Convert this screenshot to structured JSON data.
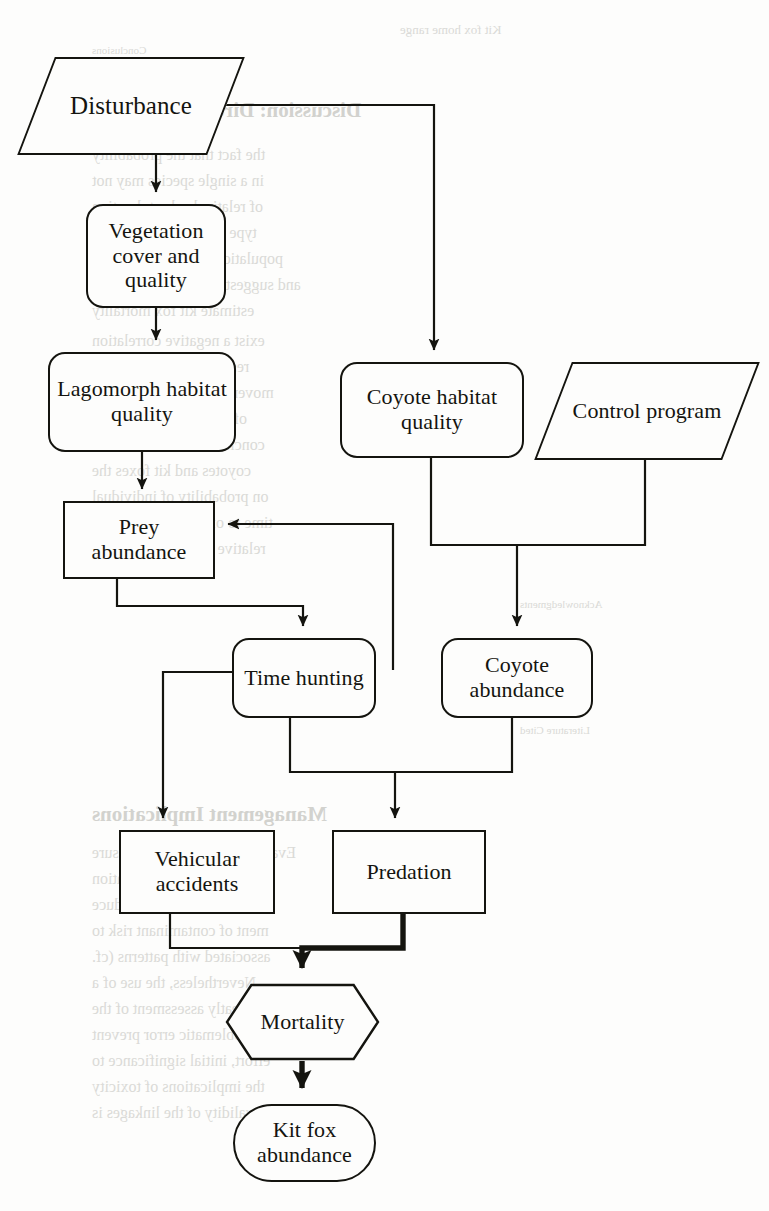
{
  "figure": {
    "line_color": "#14140f",
    "background": "#fdfdfc",
    "nodes": [
      {
        "id": "disturbance",
        "label": "Disturbance",
        "shape": "parallelogram",
        "x": 36,
        "y": 57,
        "w": 190,
        "h": 98,
        "font": 25
      },
      {
        "id": "vegetation",
        "label": "Vegetation cover and quality",
        "shape": "rounded",
        "x": 86,
        "y": 204,
        "w": 140,
        "h": 104,
        "font": 22
      },
      {
        "id": "lagomorph",
        "label": "Lagomorph habitat quality",
        "shape": "rounded",
        "x": 48,
        "y": 352,
        "w": 188,
        "h": 100,
        "font": 22
      },
      {
        "id": "coyote-habitat",
        "label": "Coyote habitat quality",
        "shape": "rounded",
        "x": 340,
        "y": 362,
        "w": 184,
        "h": 96,
        "font": 22
      },
      {
        "id": "control-program",
        "label": "Control program",
        "shape": "parallelogram",
        "x": 553,
        "y": 362,
        "w": 188,
        "h": 98,
        "font": 22
      },
      {
        "id": "prey-abundance",
        "label": "Prey abundance",
        "shape": "rect",
        "x": 63,
        "y": 501,
        "w": 152,
        "h": 78,
        "font": 22
      },
      {
        "id": "time-hunting",
        "label": "Time hunting",
        "shape": "rounded",
        "x": 232,
        "y": 638,
        "w": 144,
        "h": 80,
        "font": 22
      },
      {
        "id": "coyote-abundance",
        "label": "Coyote abundance",
        "shape": "rounded",
        "x": 441,
        "y": 638,
        "w": 152,
        "h": 80,
        "font": 22
      },
      {
        "id": "vehicular",
        "label": "Vehicular accidents",
        "shape": "rect",
        "x": 119,
        "y": 830,
        "w": 156,
        "h": 84,
        "font": 22
      },
      {
        "id": "predation",
        "label": "Predation",
        "shape": "rect",
        "x": 332,
        "y": 830,
        "w": 154,
        "h": 84,
        "font": 22
      },
      {
        "id": "mortality",
        "label": "Mortality",
        "shape": "hexagon",
        "x": 225,
        "y": 983,
        "w": 155,
        "h": 78,
        "font": 22
      },
      {
        "id": "kit-fox",
        "label": "Kit fox abundance",
        "shape": "stadium",
        "x": 233,
        "y": 1104,
        "w": 143,
        "h": 78,
        "font": 22
      }
    ],
    "edges": [
      {
        "id": "disturbance-to-vegetation",
        "from": "disturbance",
        "to": "vegetation",
        "weight": "thin"
      },
      {
        "id": "disturbance-to-coyote-habitat",
        "from": "disturbance",
        "to": "coyote-habitat",
        "weight": "thin"
      },
      {
        "id": "vegetation-to-lagomorph",
        "from": "vegetation",
        "to": "lagomorph",
        "weight": "thin"
      },
      {
        "id": "lagomorph-to-prey-abundance",
        "from": "lagomorph",
        "to": "prey-abundance",
        "weight": "thin"
      },
      {
        "id": "coyote-habitat-to-coyote-abundance",
        "from": "coyote-habitat",
        "to": "coyote-abundance",
        "weight": "thin"
      },
      {
        "id": "control-program-to-coyote-abundance",
        "from": "control-program",
        "to": "coyote-abundance",
        "weight": "thin"
      },
      {
        "id": "prey-abundance-to-time-hunting",
        "from": "prey-abundance",
        "to": "time-hunting",
        "weight": "thin"
      },
      {
        "id": "coyote-abundance-to-prey-abundance",
        "from": "coyote-abundance",
        "to": "prey-abundance",
        "weight": "thin"
      },
      {
        "id": "time-hunting-to-vehicular",
        "from": "time-hunting",
        "to": "vehicular",
        "weight": "thin"
      },
      {
        "id": "time-hunting-to-predation",
        "from": "time-hunting",
        "to": "predation",
        "weight": "thin"
      },
      {
        "id": "coyote-abundance-to-predation",
        "from": "coyote-abundance",
        "to": "predation",
        "weight": "thin"
      },
      {
        "id": "vehicular-to-mortality",
        "from": "vehicular",
        "to": "mortality",
        "weight": "thin"
      },
      {
        "id": "predation-to-mortality",
        "from": "predation",
        "to": "mortality",
        "weight": "thick"
      },
      {
        "id": "mortality-to-kit-fox",
        "from": "mortality",
        "to": "kit-fox",
        "weight": "thick"
      }
    ]
  },
  "bleed_text": {
    "lines": [
      {
        "text": "Discussion: Direct Attribution",
        "x": 92,
        "y": 98,
        "size": 21,
        "head": true
      },
      {
        "text": "the fact that the probability",
        "x": 92,
        "y": 146,
        "size": 16,
        "head": false
      },
      {
        "text": "in a single species may not",
        "x": 92,
        "y": 172,
        "size": 16,
        "head": false
      },
      {
        "text": "of relatively short duration",
        "x": 92,
        "y": 198,
        "size": 16,
        "head": false
      },
      {
        "text": "type of model. the overall",
        "x": 92,
        "y": 224,
        "size": 16,
        "head": false
      },
      {
        "text": "population was a low concern",
        "x": 92,
        "y": 250,
        "size": 16,
        "head": false
      },
      {
        "text": "and suggestion that the variables",
        "x": 92,
        "y": 276,
        "size": 16,
        "head": false
      },
      {
        "text": "estimate kit fox mortality",
        "x": 92,
        "y": 302,
        "size": 16,
        "head": false
      },
      {
        "text": "exist a negative correlation",
        "x": 92,
        "y": 332,
        "size": 16,
        "head": false
      },
      {
        "text": "resource availability and",
        "x": 92,
        "y": 358,
        "size": 16,
        "head": false
      },
      {
        "text": "movements and the duration",
        "x": 92,
        "y": 384,
        "size": 16,
        "head": false
      },
      {
        "text": "of data from kit foxes in",
        "x": 92,
        "y": 410,
        "size": 16,
        "head": false
      },
      {
        "text": "conclude it due not to infer",
        "x": 92,
        "y": 436,
        "size": 16,
        "head": false
      },
      {
        "text": "coyotes and kit foxes the",
        "x": 92,
        "y": 462,
        "size": 16,
        "head": false
      },
      {
        "text": "on probability of individual",
        "x": 92,
        "y": 488,
        "size": 16,
        "head": false
      },
      {
        "text": "time to of and are correlated",
        "x": 92,
        "y": 514,
        "size": 16,
        "head": false
      },
      {
        "text": "relative to other abundance",
        "x": 92,
        "y": 540,
        "size": 16,
        "head": false
      },
      {
        "text": "Management Implications",
        "x": 92,
        "y": 802,
        "size": 21,
        "head": true
      },
      {
        "text": "Evaluation of toxicant exposure",
        "x": 92,
        "y": 844,
        "size": 16,
        "head": false
      },
      {
        "text": "implications. Site utilization",
        "x": 92,
        "y": 870,
        "size": 16,
        "head": false
      },
      {
        "text": "ures to reduce risk or reduce",
        "x": 92,
        "y": 896,
        "size": 16,
        "head": false
      },
      {
        "text": "ment of contaminant risk to",
        "x": 92,
        "y": 922,
        "size": 16,
        "head": false
      },
      {
        "text": "associated with patterns (cf.",
        "x": 92,
        "y": 948,
        "size": 16,
        "head": false
      },
      {
        "text": "Nevertheless, the use of a",
        "x": 92,
        "y": 974,
        "size": 16,
        "head": false
      },
      {
        "text": "greatly assessment of the",
        "x": 92,
        "y": 1000,
        "size": 16,
        "head": false
      },
      {
        "text": "ably problematic error prevent",
        "x": 92,
        "y": 1026,
        "size": 16,
        "head": false
      },
      {
        "text": "effort, initial significance to",
        "x": 92,
        "y": 1052,
        "size": 16,
        "head": false
      },
      {
        "text": "the implications of toxicity",
        "x": 92,
        "y": 1078,
        "size": 16,
        "head": false
      },
      {
        "text": "the validity of the linkages is",
        "x": 92,
        "y": 1104,
        "size": 16,
        "head": false
      },
      {
        "text": "Conclusions",
        "x": 92,
        "y": 44,
        "size": 11,
        "head": false
      },
      {
        "text": "Kit fox home range",
        "x": 400,
        "y": 22,
        "size": 13,
        "head": false
      },
      {
        "text": "Acknowledgments",
        "x": 520,
        "y": 598,
        "size": 11,
        "head": false
      },
      {
        "text": "Literature Cited",
        "x": 520,
        "y": 724,
        "size": 11,
        "head": false
      }
    ]
  }
}
